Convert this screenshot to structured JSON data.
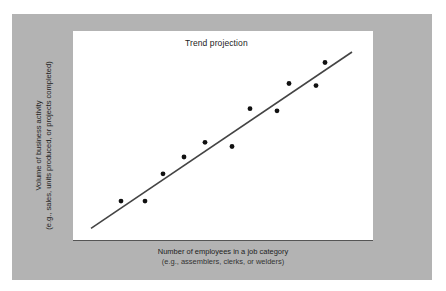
{
  "chart_data": {
    "type": "scatter",
    "title": "Trend projection",
    "xlabel": "Number of employees in a job category",
    "xlabel_sub": "(e.g., assemblers, clerks, or welders)",
    "ylabel": "Volume of business activity",
    "ylabel_sub": "(e.g., sales, units produced, or projects completed)",
    "grid": false,
    "legend": null,
    "axis_ticks": "none",
    "xlim": [
      0,
      100
    ],
    "ylim": [
      0,
      100
    ],
    "points": [
      {
        "x": 16,
        "y": 19
      },
      {
        "x": 24,
        "y": 19
      },
      {
        "x": 30,
        "y": 32
      },
      {
        "x": 37,
        "y": 40
      },
      {
        "x": 44,
        "y": 47
      },
      {
        "x": 53,
        "y": 45
      },
      {
        "x": 59,
        "y": 63
      },
      {
        "x": 68,
        "y": 62
      },
      {
        "x": 72,
        "y": 75
      },
      {
        "x": 81,
        "y": 74
      },
      {
        "x": 84,
        "y": 85
      }
    ],
    "trend_line": {
      "x1": 6,
      "y1": 6,
      "x2": 93,
      "y2": 90
    },
    "colors": {
      "panel": "#b3b3b3",
      "plot_bg": "#ffffff",
      "points": "#111111",
      "line": "#444444"
    }
  }
}
